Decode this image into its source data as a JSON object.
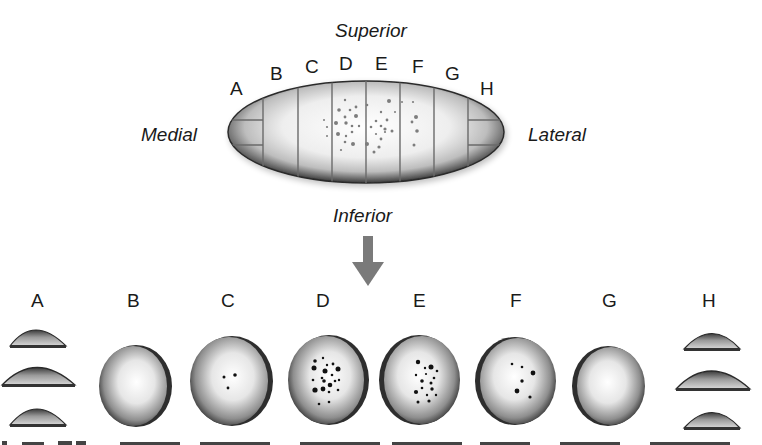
{
  "diagram": {
    "orientation": {
      "superior": "Superior",
      "inferior": "Inferior",
      "medial": "Medial",
      "lateral": "Lateral"
    },
    "top_section_labels": [
      "A",
      "B",
      "C",
      "D",
      "E",
      "F",
      "G",
      "H"
    ],
    "bottom_section_labels": [
      "A",
      "B",
      "C",
      "D",
      "E",
      "F",
      "G",
      "H"
    ],
    "arrow": "down-arrow",
    "colors": {
      "background": "#ffffff",
      "text": "#1a1a1a",
      "arrow": "#7a7a7a",
      "shape_dark": "#2a2a2a",
      "shape_light": "#f4f4f4",
      "dots": "#111111"
    },
    "sections": [
      {
        "label": "A",
        "shape": "end-cap-stack",
        "dots": 0
      },
      {
        "label": "B",
        "shape": "disc",
        "dots": 0
      },
      {
        "label": "C",
        "shape": "disc",
        "dots": 3
      },
      {
        "label": "D",
        "shape": "disc",
        "dots": 20
      },
      {
        "label": "E",
        "shape": "disc",
        "dots": 16
      },
      {
        "label": "F",
        "shape": "disc",
        "dots": 6
      },
      {
        "label": "G",
        "shape": "disc",
        "dots": 0
      },
      {
        "label": "H",
        "shape": "end-cap-stack",
        "dots": 0
      }
    ]
  }
}
